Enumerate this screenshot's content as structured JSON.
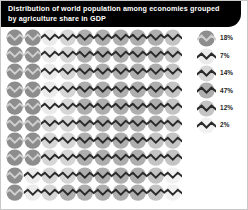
{
  "header": {
    "title": "Distribution of world population among economies grouped\nby agriculture share in GDP",
    "background_color": "#000000",
    "text_color": "#ffffff"
  },
  "chart_data": {
    "type": "pie",
    "chart_style": "waffle-pictogram",
    "title": "Distribution of world population among economies grouped by agriculture share in GDP",
    "xlabel": "",
    "ylabel": "",
    "unit": "percent of world population",
    "total_units": 100,
    "grid_rows": 10,
    "grid_columns": 10,
    "icon_name": "zigzag-chevron-icon",
    "categories": [
      "18%",
      "7%",
      "14%",
      "47%",
      "12%",
      "2%"
    ],
    "values": [
      18,
      7,
      14,
      47,
      12,
      2
    ],
    "colors": [
      "#8d8d8d",
      "#ebebeb",
      "#d6d6d6",
      "#aeaeae",
      "#c4c4c4",
      "#f1f1f1"
    ],
    "glyph_colors": [
      "#cfcfcf",
      "#2a2a2a",
      "#2a2a2a",
      "#2a2a2a",
      "#2a2a2a",
      "#2a2a2a"
    ],
    "legend_position": "right",
    "grid": false
  },
  "legend": {
    "entries": [
      {
        "label": "18%",
        "color": "#8d8d8d",
        "glyph": "#cfcfcf"
      },
      {
        "label": "7%",
        "color": "#ebebeb",
        "glyph": "#2a2a2a"
      },
      {
        "label": "14%",
        "color": "#d6d6d6",
        "glyph": "#2a2a2a"
      },
      {
        "label": "47%",
        "color": "#aeaeae",
        "glyph": "#2a2a2a"
      },
      {
        "label": "12%",
        "color": "#c4c4c4",
        "glyph": "#2a2a2a"
      },
      {
        "label": "2%",
        "color": "#f1f1f1",
        "glyph": "#2a2a2a"
      }
    ]
  }
}
